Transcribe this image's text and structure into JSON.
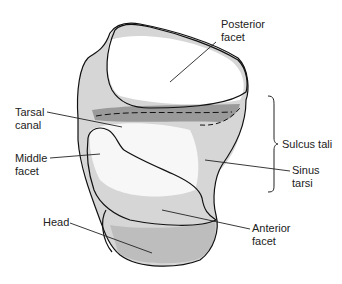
{
  "figure": {
    "labels": {
      "posterior_facet": "Posterior\nfacet",
      "tarsal_canal": "Tarsal\ncanal",
      "middle_facet": "Middle\nfacet",
      "sulcus_tali": "Sulcus tali",
      "sinus_tarsi": "Sinus\ntarsi",
      "head": "Head",
      "anterior_facet": "Anterior\nfacet"
    },
    "colors": {
      "outline": "#111111",
      "shade_light": "#d9d9d9",
      "shade_mid": "#b5b5b5",
      "shade_dark": "#8c8c8c",
      "background": "#ffffff"
    }
  }
}
